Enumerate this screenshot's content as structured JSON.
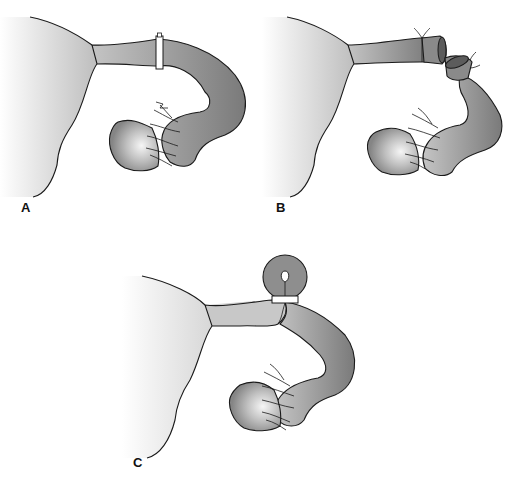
{
  "figure": {
    "type": "anatomical-illustration",
    "colors": {
      "background": "#ffffff",
      "uterus_light": "#f4f4f4",
      "uterus_mid": "#c9c9c9",
      "tube_dark": "#7e7e7e",
      "tube_mid": "#9a9a9a",
      "ovary_highlight": "#f2f2f2",
      "ovary_shade": "#8c8c8c",
      "outline": "#1a1a1a",
      "clip": "#ffffff"
    },
    "panels": [
      {
        "id": "A",
        "label": "A",
        "description": "Fallopian tube with occlusive ring/clip applied"
      },
      {
        "id": "B",
        "label": "B",
        "description": "Tube transected with ligated cut ends"
      },
      {
        "id": "C",
        "label": "C",
        "description": "Looped tube segment with ring at base (knuckle)"
      }
    ]
  }
}
